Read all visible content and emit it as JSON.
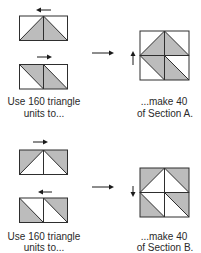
{
  "colors": {
    "shade": "#bcbcbc",
    "line": "#2e2e2e",
    "text": "#2a2a2a",
    "background": "#ffffff"
  },
  "section_a": {
    "units": [
      {
        "name": "triangle-unit-apex-shaded",
        "press_arrow": "left"
      },
      {
        "name": "triangle-unit-parallelogram-shaded",
        "press_arrow": "right"
      }
    ],
    "units_caption": {
      "line1": "Use 160 triangle",
      "line2": "units to..."
    },
    "flow_arrow": "right",
    "block_press_arrow": "up",
    "result_caption": {
      "line1": "...make 40",
      "line2": "of Section A."
    }
  },
  "section_b": {
    "units": [
      {
        "name": "triangle-unit-corners-shaded",
        "press_arrow": "right"
      },
      {
        "name": "triangle-unit-outer-shaded",
        "press_arrow": "left"
      }
    ],
    "units_caption": {
      "line1": "Use 160 triangle",
      "line2": "units to..."
    },
    "flow_arrow": "right",
    "block_press_arrow": "down",
    "result_caption": {
      "line1": "...make 40",
      "line2": "of Section B."
    }
  }
}
